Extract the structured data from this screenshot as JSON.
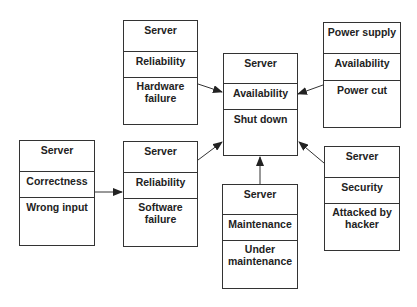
{
  "diagram": {
    "center": {
      "object": "Server",
      "attribute": "Availability",
      "state": "Shut down"
    },
    "causes": [
      {
        "id": "hardware",
        "object": "Server",
        "attribute": "Reliability",
        "state": "Hardware failure"
      },
      {
        "id": "power",
        "object": "Power supply",
        "attribute": "Availability",
        "state": "Power cut"
      },
      {
        "id": "software",
        "object": "Server",
        "attribute": "Reliability",
        "state": "Software failure"
      },
      {
        "id": "maintenance",
        "object": "Server",
        "attribute": "Maintenance",
        "state": "Under maintenance"
      },
      {
        "id": "security",
        "object": "Server",
        "attribute": "Security",
        "state": "Attacked by hacker"
      },
      {
        "id": "correctness",
        "object": "Server",
        "attribute": "Correctness",
        "state": "Wrong input"
      }
    ],
    "edges": [
      {
        "from": "hardware",
        "to": "center"
      },
      {
        "from": "power",
        "to": "center"
      },
      {
        "from": "software",
        "to": "center"
      },
      {
        "from": "maintenance",
        "to": "center"
      },
      {
        "from": "security",
        "to": "center"
      },
      {
        "from": "correctness",
        "to": "software"
      }
    ]
  }
}
